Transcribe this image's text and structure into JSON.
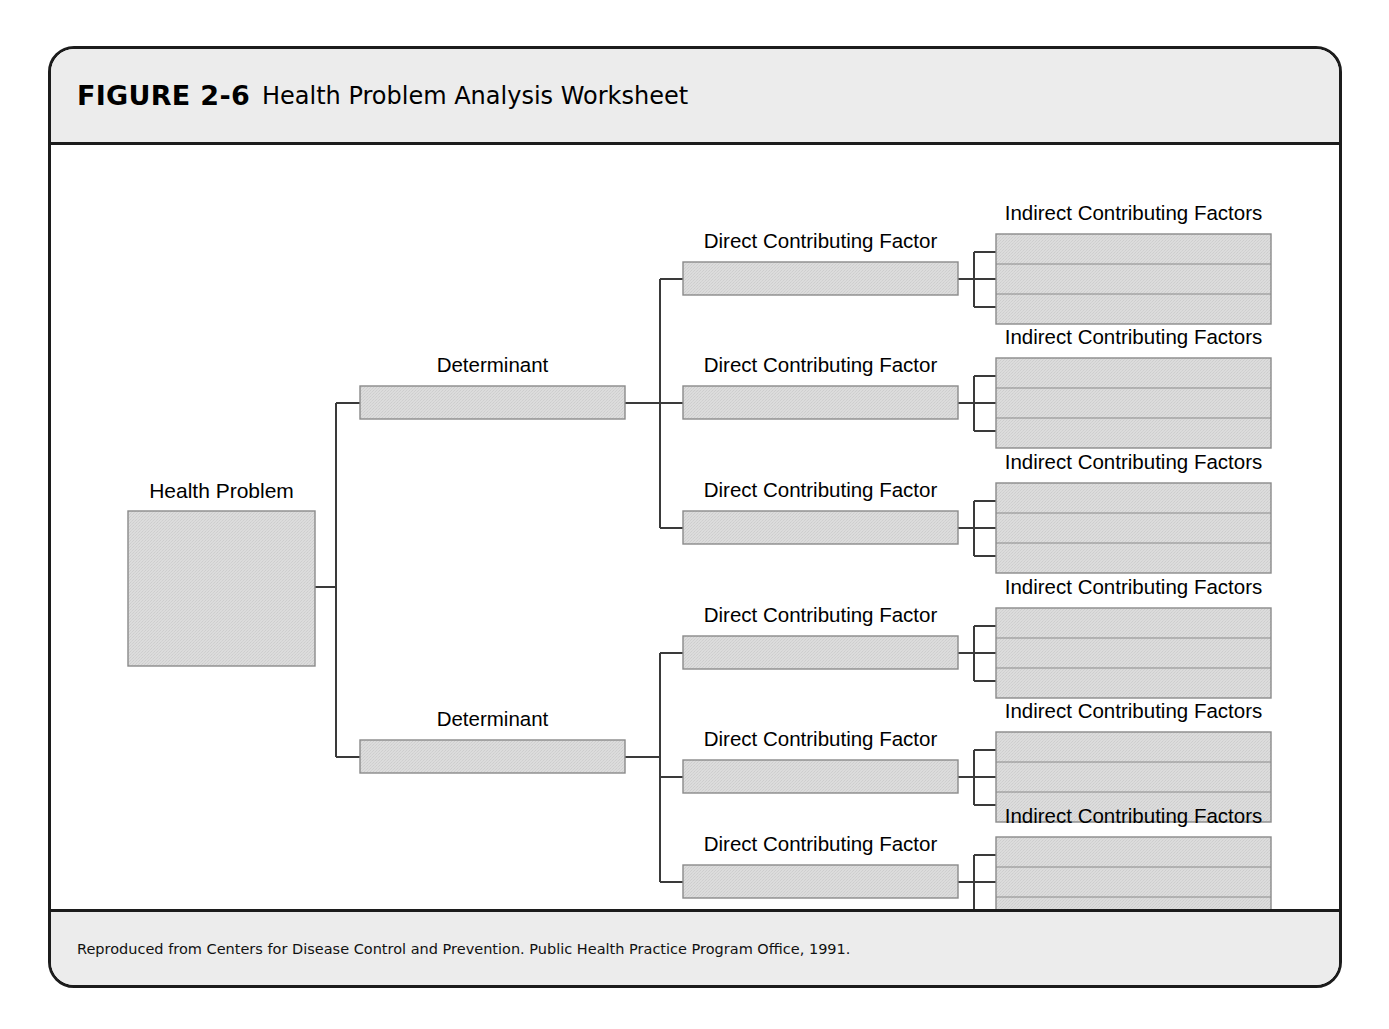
{
  "figure": {
    "label": "FIGURE 2-6",
    "title": "Health Problem Analysis Worksheet",
    "source": "Reproduced from Centers for Disease Control and Prevention. Public Health Practice Program Office, 1991."
  },
  "colors": {
    "frame_border": "#1c1c1c",
    "band_background": "#ececec",
    "page_background": "#ffffff",
    "box_fill": "#d9d9d9",
    "box_border": "#8a8a8a",
    "connector_line": "#3a3a3a",
    "text": "#000000"
  },
  "diagram": {
    "type": "tree",
    "orientation": "left-to-right",
    "levels": [
      "Health Problem",
      "Determinant",
      "Direct Contributing Factor",
      "Indirect Contributing Factors"
    ],
    "root": {
      "label": "Health Problem",
      "shape": "large-rectangle",
      "fill": "#d9d9d9",
      "writable": true
    },
    "determinants": [
      {
        "label": "Determinant",
        "direct_factors": [
          {
            "label": "Direct Contributing Factor",
            "indirect": {
              "label": "Indirect Contributing Factors",
              "rows": 3
            }
          },
          {
            "label": "Direct Contributing Factor",
            "indirect": {
              "label": "Indirect Contributing Factors",
              "rows": 3
            }
          },
          {
            "label": "Direct Contributing Factor",
            "indirect": {
              "label": "Indirect Contributing Factors",
              "rows": 3
            }
          }
        ]
      },
      {
        "label": "Determinant",
        "direct_factors": [
          {
            "label": "Direct Contributing Factor",
            "indirect": {
              "label": "Indirect Contributing Factors",
              "rows": 3
            }
          },
          {
            "label": "Direct Contributing Factor",
            "indirect": {
              "label": "Indirect Contributing Factors",
              "rows": 3
            }
          },
          {
            "label": "Direct Contributing Factor",
            "indirect": {
              "label": "Indirect Contributing Factors",
              "rows": 3
            }
          }
        ]
      }
    ],
    "counts": {
      "health_problems": 1,
      "determinants": 2,
      "direct_contributing_factors": 6,
      "indirect_contributing_factor_blocks": 6,
      "indirect_rows_per_block": 3
    }
  }
}
